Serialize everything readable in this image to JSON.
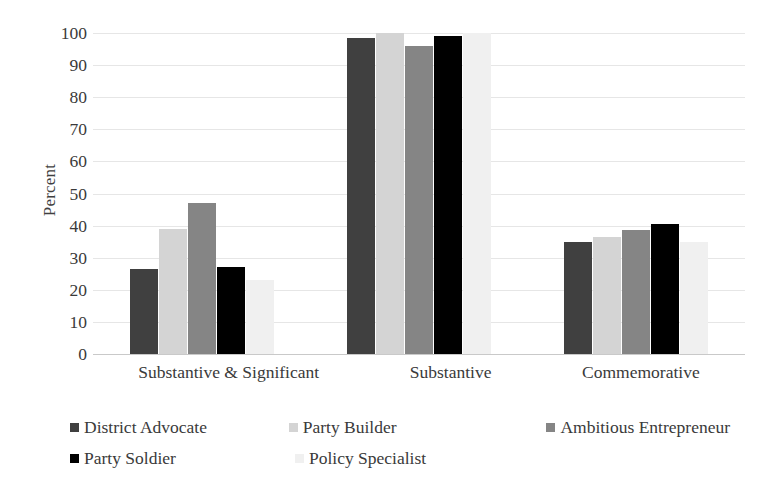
{
  "chart_data": {
    "type": "bar",
    "title": "",
    "xlabel": "",
    "ylabel": "Percent",
    "ylim": [
      0,
      100
    ],
    "ytick_step": 10,
    "yticks": [
      100,
      90,
      80,
      70,
      60,
      50,
      40,
      30,
      20,
      10,
      0
    ],
    "grid": true,
    "legend_position": "bottom",
    "categories": [
      "Substantive & Significant",
      "Substantive",
      "Commemorative"
    ],
    "series": [
      {
        "name": "District Advocate",
        "color": "#404040",
        "values": [
          26.5,
          98.5,
          35.0
        ]
      },
      {
        "name": "Party Builder",
        "color": "#d4d4d4",
        "values": [
          39.0,
          100.0,
          36.5
        ]
      },
      {
        "name": "Ambitious Entrepreneur",
        "color": "#858585",
        "values": [
          47.0,
          96.0,
          38.5
        ]
      },
      {
        "name": "Party Soldier",
        "color": "#000000",
        "values": [
          27.0,
          99.0,
          40.5
        ]
      },
      {
        "name": "Policy Specialist",
        "color": "#f0f0f0",
        "values": [
          23.0,
          100.0,
          35.0
        ]
      }
    ]
  },
  "legend": {
    "rows": [
      [
        {
          "label": "District Advocate",
          "color": "#404040"
        },
        {
          "label": "Party Builder",
          "color": "#d4d4d4"
        },
        {
          "label": "Ambitious Entrepreneur",
          "color": "#858585"
        }
      ],
      [
        {
          "label": "Party Soldier",
          "color": "#000000"
        },
        {
          "label": "Policy Specialist",
          "color": "#f0f0f0"
        }
      ]
    ]
  }
}
